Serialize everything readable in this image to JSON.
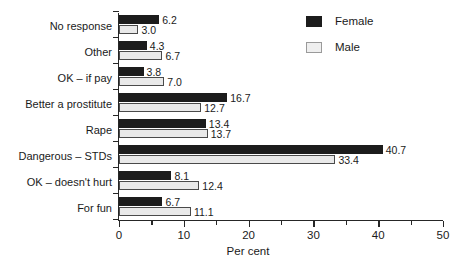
{
  "chart_data": {
    "type": "bar",
    "orientation": "horizontal",
    "title": "",
    "xlabel": "Per cent",
    "ylabel": "",
    "xlim": [
      0,
      50
    ],
    "xticks": [
      0,
      10,
      20,
      30,
      40,
      50
    ],
    "xtick_labels": [
      "0",
      "10",
      "20",
      "30",
      "40",
      "50"
    ],
    "minor_xticks": [
      5,
      15,
      25,
      35,
      45
    ],
    "grid": false,
    "legend_position": "top-right",
    "categories": [
      "No response",
      "Other",
      "OK – if pay",
      "Better a prostitute",
      "Rape",
      "Dangerous – STDs",
      "OK – doesn't hurt",
      "For fun"
    ],
    "series": [
      {
        "name": "Female",
        "color": "#1c1c1c",
        "values": [
          6.2,
          4.3,
          3.8,
          16.7,
          13.4,
          40.7,
          8.1,
          6.7
        ],
        "value_labels": [
          "6.2",
          "4.3",
          "3.8",
          "16.7",
          "13.4",
          "40.7",
          "8.1",
          "6.7"
        ]
      },
      {
        "name": "Male",
        "color": "#e9e9e9",
        "values": [
          3.0,
          6.7,
          7.0,
          12.7,
          13.7,
          33.4,
          12.4,
          11.1
        ],
        "value_labels": [
          "3.0",
          "6.7",
          "7.0",
          "12.7",
          "13.7",
          "33.4",
          "12.4",
          "11.1"
        ]
      }
    ]
  },
  "legend": {
    "items": [
      {
        "label": "Female"
      },
      {
        "label": "Male"
      }
    ]
  },
  "axis": {
    "x_title": "Per cent"
  }
}
